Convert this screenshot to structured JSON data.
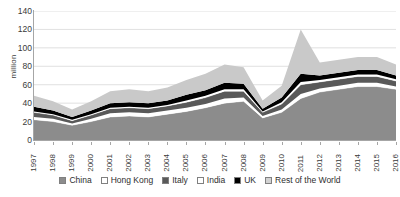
{
  "chart_data": {
    "type": "area",
    "stacked": true,
    "title": "",
    "xlabel": "",
    "ylabel": "million",
    "ylim": [
      0,
      140
    ],
    "ytick_step": 20,
    "yticks": [
      140,
      120,
      100,
      80,
      60,
      40,
      20,
      0
    ],
    "grid": true,
    "grid_axis": "y",
    "legend_position": "bottom",
    "categories": [
      "1997",
      "1998",
      "1999",
      "2000",
      "2001",
      "2002",
      "2003",
      "2004",
      "2005",
      "2006",
      "2007",
      "2008",
      "2009",
      "2010",
      "2011",
      "2012",
      "2013",
      "2014",
      "2015",
      "2016"
    ],
    "series": [
      {
        "name": "China",
        "color": "#8c8c8c",
        "values": [
          22,
          20,
          16,
          20,
          25,
          26,
          25,
          28,
          31,
          35,
          40,
          42,
          24,
          30,
          45,
          52,
          55,
          58,
          58,
          55
        ]
      },
      {
        "name": "Hong Kong",
        "color": "#ffffff",
        "values": [
          3,
          3,
          2,
          3,
          4,
          4,
          4,
          4,
          4,
          4,
          5,
          4,
          2,
          3,
          5,
          4,
          4,
          4,
          4,
          3
        ]
      },
      {
        "name": "Italy",
        "color": "#595959",
        "values": [
          5,
          4,
          3,
          4,
          5,
          5,
          5,
          5,
          6,
          7,
          8,
          7,
          4,
          6,
          10,
          7,
          7,
          7,
          7,
          6
        ]
      },
      {
        "name": "India",
        "color": "#ffffff",
        "values": [
          1,
          1,
          1,
          1,
          1,
          1,
          1,
          1,
          2,
          2,
          2,
          2,
          1,
          2,
          3,
          2,
          2,
          2,
          2,
          2
        ]
      },
      {
        "name": "UK",
        "color": "#000000",
        "values": [
          5,
          4,
          3,
          4,
          5,
          5,
          5,
          5,
          6,
          6,
          7,
          6,
          3,
          5,
          9,
          5,
          5,
          5,
          5,
          4
        ]
      },
      {
        "name": "Rest of the World",
        "color": "#c9c9c9",
        "values": [
          12,
          10,
          8,
          10,
          13,
          14,
          13,
          14,
          16,
          18,
          20,
          18,
          9,
          13,
          48,
          14,
          14,
          14,
          14,
          12
        ]
      }
    ],
    "totals": [
      48,
      42,
      33,
      42,
      53,
      55,
      53,
      57,
      65,
      72,
      82,
      79,
      43,
      59,
      120,
      84,
      87,
      90,
      90,
      82
    ]
  },
  "legend": {
    "items": [
      {
        "label": "China",
        "swatch": "#8c8c8c"
      },
      {
        "label": "Hong Kong",
        "swatch": "#ffffff"
      },
      {
        "label": "Italy",
        "swatch": "#595959"
      },
      {
        "label": "India",
        "swatch": "#ffffff"
      },
      {
        "label": "UK",
        "swatch": "#000000"
      },
      {
        "label": "Rest of the World",
        "swatch": "#d2d2d2"
      }
    ]
  },
  "axis": {
    "y_label": "million"
  }
}
